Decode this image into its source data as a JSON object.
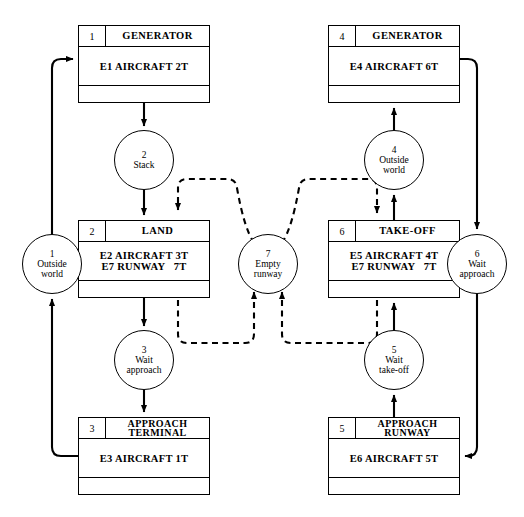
{
  "diagram": {
    "stroke_color": "#000000",
    "background": "#ffffff"
  },
  "activities": [
    {
      "id": "generator-1",
      "number": "1",
      "title": "GENERATOR",
      "lines": [
        "E1 AIRCRAFT 2T"
      ],
      "x": 78,
      "y": 25,
      "w": 132,
      "h": 78,
      "mid_h": 38
    },
    {
      "id": "generator-4",
      "number": "4",
      "title": "GENERATOR",
      "lines": [
        "E4 AIRCRAFT 6T"
      ],
      "x": 328,
      "y": 25,
      "w": 132,
      "h": 78,
      "mid_h": 38
    },
    {
      "id": "land-2",
      "number": "2",
      "title": "LAND",
      "lines": [
        "E2 AIRCRAFT 3T",
        "E7 RUNWAY   7T"
      ],
      "x": 78,
      "y": 220,
      "w": 132,
      "h": 78,
      "mid_h": 38
    },
    {
      "id": "takeoff-6",
      "number": "6",
      "title": "TAKE-OFF",
      "lines": [
        "E5 AIRCRAFT 4T",
        "E7 RUNWAY   7T"
      ],
      "x": 328,
      "y": 220,
      "w": 132,
      "h": 78,
      "mid_h": 38
    },
    {
      "id": "approach-terminal-3",
      "number": "3",
      "title": "APPROACH\nTERMINAL",
      "lines": [
        "E3 AIRCRAFT 1T"
      ],
      "x": 78,
      "y": 417,
      "w": 132,
      "h": 78,
      "mid_h": 38
    },
    {
      "id": "approach-runway-5",
      "number": "5",
      "title": "APPROACH\nRUNWAY",
      "lines": [
        "E6 AIRCRAFT 5T"
      ],
      "x": 328,
      "y": 417,
      "w": 132,
      "h": 78,
      "mid_h": 38
    }
  ],
  "queues": [
    {
      "id": "queue-outside-world-1",
      "number": "1",
      "label": "Outside\nworld",
      "cx": 52,
      "cy": 264,
      "r": 30
    },
    {
      "id": "queue-stack-2",
      "number": "2",
      "label": "Stack",
      "cx": 144,
      "cy": 160,
      "r": 30
    },
    {
      "id": "queue-wait-approach-3",
      "number": "3",
      "label": "Wait\napproach",
      "cx": 144,
      "cy": 360,
      "r": 30
    },
    {
      "id": "queue-outside-world-4",
      "number": "4",
      "label": "Outside\nworld",
      "cx": 394,
      "cy": 160,
      "r": 30
    },
    {
      "id": "queue-wait-takeoff-5",
      "number": "5",
      "label": "Wait\ntake-off",
      "cx": 394,
      "cy": 360,
      "r": 30
    },
    {
      "id": "queue-wait-approach-6",
      "number": "6",
      "label": "Wait\napproach",
      "cx": 477,
      "cy": 264,
      "r": 30
    },
    {
      "id": "queue-empty-runway-7",
      "number": "7",
      "label": "Empty\nrunway",
      "cx": 268,
      "cy": 264,
      "r": 30
    }
  ],
  "connections": [
    {
      "id": "conn-outsideworld1-to-generator1",
      "style": "solid",
      "from": "queue-outside-world-1",
      "to": "generator-1"
    },
    {
      "id": "conn-generator1-to-stack2",
      "style": "solid",
      "from": "generator-1",
      "to": "queue-stack-2"
    },
    {
      "id": "conn-stack2-to-land2",
      "style": "solid",
      "from": "queue-stack-2",
      "to": "land-2"
    },
    {
      "id": "conn-land2-to-waitapproach3",
      "style": "solid",
      "from": "land-2",
      "to": "queue-wait-approach-3"
    },
    {
      "id": "conn-waitapproach3-to-approachterminal3",
      "style": "solid",
      "from": "queue-wait-approach-3",
      "to": "approach-terminal-3"
    },
    {
      "id": "conn-approachterminal3-to-outsideworld1",
      "style": "solid",
      "from": "approach-terminal-3",
      "to": "queue-outside-world-1"
    },
    {
      "id": "conn-generator4-to-waitapproach6",
      "style": "solid",
      "from": "generator-4",
      "to": "queue-wait-approach-6"
    },
    {
      "id": "conn-waitapproach6-to-approachrunway5",
      "style": "solid",
      "from": "queue-wait-approach-6",
      "to": "approach-runway-5"
    },
    {
      "id": "conn-approachrunway5-to-waittakeoff5",
      "style": "solid",
      "from": "approach-runway-5",
      "to": "queue-wait-takeoff-5"
    },
    {
      "id": "conn-waittakeoff5-to-takeoff6",
      "style": "solid",
      "from": "queue-wait-takeoff-5",
      "to": "takeoff-6"
    },
    {
      "id": "conn-takeoff6-to-outsideworld4",
      "style": "solid",
      "from": "takeoff-6",
      "to": "queue-outside-world-4"
    },
    {
      "id": "conn-outsideworld4-to-generator4",
      "style": "solid",
      "from": "queue-outside-world-4",
      "to": "generator-4"
    },
    {
      "id": "conn-emptyrunway7-to-land2",
      "style": "dashed",
      "from": "queue-empty-runway-7",
      "to": "land-2"
    },
    {
      "id": "conn-emptyrunway7-to-takeoff6",
      "style": "dashed",
      "from": "queue-empty-runway-7",
      "to": "takeoff-6"
    },
    {
      "id": "conn-land2-to-emptyrunway7",
      "style": "dashed",
      "from": "land-2",
      "to": "queue-empty-runway-7"
    },
    {
      "id": "conn-takeoff6-to-emptyrunway7",
      "style": "dashed",
      "from": "takeoff-6",
      "to": "queue-empty-runway-7"
    }
  ]
}
